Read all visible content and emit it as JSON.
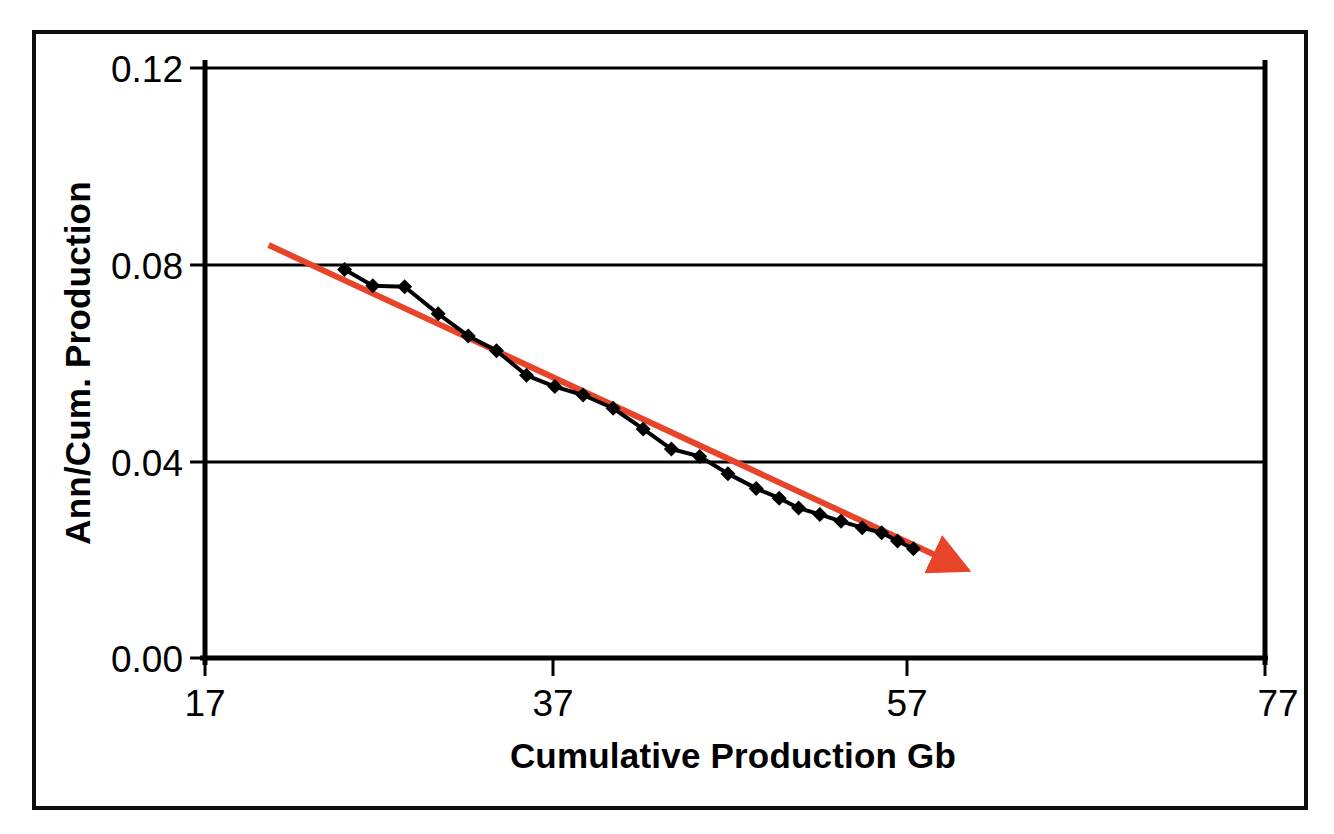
{
  "figure": {
    "background_color": "#ffffff",
    "frame_color": "#0e0e0e"
  },
  "chart_data": {
    "type": "line",
    "title": "",
    "subtitle": "",
    "xlabel": "Cumulative Production Gb",
    "ylabel": "Ann/Cum. Production",
    "xlim": [
      17,
      77
    ],
    "ylim": [
      0.0,
      0.12
    ],
    "xticks": [
      17,
      37,
      57,
      77
    ],
    "xtick_labels": [
      "17",
      "37",
      "57",
      "77"
    ],
    "yticks": [
      0.0,
      0.04,
      0.08,
      0.12
    ],
    "ytick_labels": [
      "0.00",
      "0.04",
      "0.08",
      "0.12"
    ],
    "grid": "horizontal",
    "grid_color": "#000000",
    "legend": "none",
    "series": [
      {
        "name": "Ann/Cum. Production",
        "type": "line",
        "color": "#000000",
        "marker": "diamond",
        "marker_color": "#000000",
        "line_width": 4,
        "x": [
          24.9,
          26.5,
          28.3,
          30.2,
          31.9,
          33.5,
          35.2,
          36.8,
          38.4,
          40.1,
          41.8,
          43.4,
          45.0,
          46.6,
          48.2,
          49.5,
          50.6,
          51.8,
          53.0,
          54.2,
          55.3,
          56.2,
          57.1
        ],
        "y": [
          0.079,
          0.0757,
          0.0755,
          0.07,
          0.0655,
          0.0625,
          0.0575,
          0.0552,
          0.0535,
          0.0508,
          0.0466,
          0.0425,
          0.041,
          0.0375,
          0.0345,
          0.0325,
          0.0305,
          0.0292,
          0.0278,
          0.0265,
          0.0255,
          0.0238,
          0.0222
        ]
      },
      {
        "name": "trend-arrow",
        "type": "arrow",
        "color": "#e8442a",
        "line_width": 6,
        "x_start": 20.6,
        "y_start": 0.084,
        "x_end": 58.9,
        "y_end": 0.02,
        "arrowhead": true
      }
    ]
  },
  "axes": {
    "y_axis_title": "Ann/Cum. Production",
    "x_axis_title": "Cumulative Production Gb",
    "y_labels": [
      "0.12",
      "0.08",
      "0.04",
      "0.00"
    ],
    "x_labels": [
      "17",
      "37",
      "57",
      "77"
    ]
  }
}
